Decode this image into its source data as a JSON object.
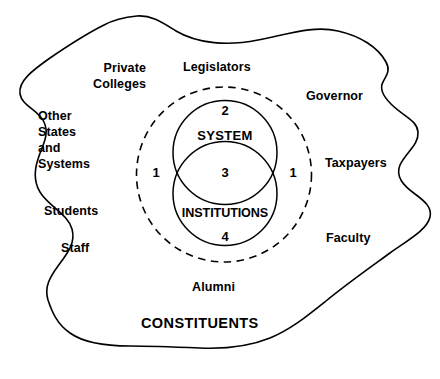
{
  "diagram": {
    "title_label": "CONSTITUENTS",
    "outer_labels": [
      {
        "id": "private-colleges",
        "text": "Private\nColleges"
      },
      {
        "id": "other-states",
        "text": "Other\nStates\nand\nSystems"
      },
      {
        "id": "students",
        "text": "Students"
      },
      {
        "id": "staff",
        "text": "Staff"
      },
      {
        "id": "legislators",
        "text": "Legislators"
      },
      {
        "id": "governor",
        "text": "Governor"
      },
      {
        "id": "taxpayers",
        "text": "Taxpayers"
      },
      {
        "id": "faculty",
        "text": "Faculty"
      },
      {
        "id": "alumni",
        "text": "Alumni"
      }
    ],
    "venn": {
      "system_label": "SYSTEM",
      "institutions_label": "INSTITUTIONS",
      "region_2": "2",
      "region_3": "3",
      "region_4": "4",
      "region_1_left": "1",
      "region_1_right": "1"
    },
    "colors": {
      "stroke": "#000000",
      "background": "#ffffff",
      "text": "#000000"
    }
  }
}
